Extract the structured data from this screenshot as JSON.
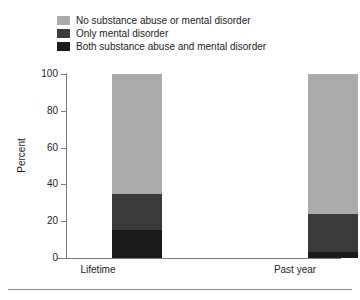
{
  "chart_data": {
    "type": "bar",
    "subtype": "stacked-bar",
    "title": "",
    "xlabel": "",
    "ylabel": "Percent",
    "ylim": [
      0,
      100
    ],
    "yticks": [
      0,
      20,
      40,
      60,
      80,
      100
    ],
    "ytick_labels": [
      "0",
      "20",
      "40",
      "60",
      "80",
      "100"
    ],
    "grid": false,
    "legend_position": "top-left",
    "categories": [
      "Lifetime",
      "Past year"
    ],
    "series": [
      {
        "name": "Both substance abuse and mental disorder",
        "color": "#1a1a1a",
        "values": [
          15,
          3
        ]
      },
      {
        "name": "Only mental disorder",
        "color": "#3a3a3a",
        "values": [
          20,
          21
        ]
      },
      {
        "name": "No substance abuse or mental disorder",
        "color": "#ababab",
        "values": [
          65,
          76
        ]
      }
    ],
    "stack_tops": {
      "Lifetime": [
        15,
        35,
        100
      ],
      "Past year": [
        3,
        24,
        100
      ]
    }
  },
  "legend": {
    "entries": [
      {
        "label": "No substance abuse or mental disorder",
        "color": "#ababab"
      },
      {
        "label": "Only mental disorder",
        "color": "#3a3a3a"
      },
      {
        "label": "Both substance abuse and mental disorder",
        "color": "#1a1a1a"
      }
    ]
  },
  "axes": {
    "y_title": "Percent",
    "y_ticks": [
      "100",
      "80",
      "60",
      "40",
      "20",
      "0"
    ],
    "x_ticks": [
      "Lifetime",
      "Past year"
    ]
  },
  "colors": {
    "no_disorder": "#ababab",
    "only_mental": "#3a3a3a",
    "both": "#1a1a1a",
    "axis": "#7a7a7a",
    "text": "#1d1d1d",
    "background": "#ffffff"
  }
}
